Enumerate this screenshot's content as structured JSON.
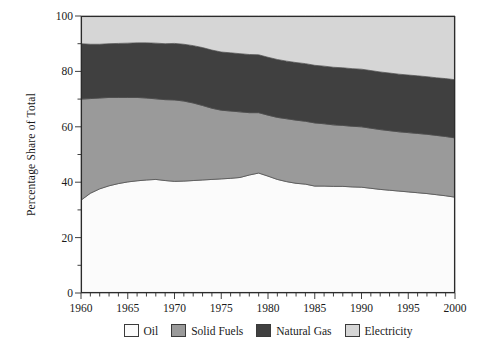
{
  "chart_data": {
    "type": "area",
    "title": "",
    "subtitle": "",
    "xlabel": "",
    "ylabel": "Percentage Share of Total",
    "xlim": [
      1960,
      2000
    ],
    "ylim": [
      0,
      100
    ],
    "grid": false,
    "stacked": true,
    "legend_position": "bottom",
    "x_major_ticks": [
      1960,
      1965,
      1970,
      1975,
      1980,
      1985,
      1990,
      1995,
      2000
    ],
    "x_tick_labels": [
      "1960",
      "1965",
      "1970",
      "1975",
      "1980",
      "1985",
      "1990",
      "1995",
      "2000"
    ],
    "x_minor_tick_step": 1,
    "y_major_ticks": [
      0,
      20,
      40,
      60,
      80,
      100
    ],
    "y_tick_labels": [
      "0",
      "20",
      "40",
      "60",
      "80",
      "100"
    ],
    "y_minor_tick_step": 10,
    "x": [
      1960,
      1961,
      1962,
      1963,
      1964,
      1965,
      1966,
      1967,
      1968,
      1969,
      1970,
      1971,
      1972,
      1973,
      1974,
      1975,
      1976,
      1977,
      1978,
      1979,
      1980,
      1981,
      1982,
      1983,
      1984,
      1985,
      1986,
      1987,
      1988,
      1989,
      1990,
      1991,
      1992,
      1993,
      1994,
      1995,
      1996,
      1997,
      1998,
      1999,
      2000
    ],
    "series": [
      {
        "name": "Oil",
        "color": "#fbfbfb",
        "values": [
          33.5,
          36.0,
          37.6,
          38.7,
          39.5,
          40.1,
          40.5,
          40.8,
          41.0,
          40.6,
          40.3,
          40.4,
          40.6,
          40.8,
          41.0,
          41.2,
          41.4,
          41.7,
          42.6,
          43.3,
          42.2,
          41.0,
          40.2,
          39.6,
          39.3,
          38.6,
          38.6,
          38.5,
          38.5,
          38.3,
          38.2,
          37.8,
          37.4,
          37.1,
          36.8,
          36.5,
          36.2,
          35.9,
          35.5,
          35.1,
          34.6
        ]
      },
      {
        "name": "Solid Fuels",
        "color": "#9a9a9a",
        "values": [
          36.5,
          34.2,
          32.8,
          31.9,
          31.1,
          30.5,
          30.1,
          29.6,
          29.1,
          29.2,
          29.4,
          28.9,
          28.0,
          26.9,
          25.7,
          24.8,
          24.3,
          23.7,
          22.5,
          21.8,
          22.0,
          22.4,
          22.7,
          22.8,
          22.7,
          22.8,
          22.5,
          22.2,
          22.0,
          21.9,
          21.8,
          21.7,
          21.6,
          21.5,
          21.4,
          21.4,
          21.4,
          21.4,
          21.4,
          21.4,
          21.4
        ]
      },
      {
        "name": "Natural Gas",
        "color": "#404040",
        "values": [
          20.0,
          19.6,
          19.4,
          19.4,
          19.5,
          19.6,
          19.7,
          19.9,
          20.1,
          20.2,
          20.4,
          20.5,
          20.7,
          20.9,
          21.0,
          21.0,
          21.0,
          21.0,
          21.0,
          20.9,
          20.9,
          20.9,
          20.8,
          20.8,
          20.8,
          20.8,
          20.8,
          20.8,
          20.8,
          20.8,
          20.8,
          20.8,
          20.8,
          20.8,
          20.8,
          20.8,
          20.8,
          20.8,
          20.8,
          20.9,
          21.0
        ]
      },
      {
        "name": "Electricity",
        "color": "#d6d6d6",
        "values": [
          10.0,
          10.2,
          10.2,
          10.0,
          9.9,
          9.8,
          9.7,
          9.7,
          9.8,
          10.0,
          9.9,
          10.2,
          10.7,
          11.4,
          12.3,
          13.0,
          13.3,
          13.6,
          13.9,
          14.0,
          14.9,
          15.7,
          16.3,
          16.8,
          17.2,
          17.8,
          18.1,
          18.5,
          18.7,
          19.0,
          19.2,
          19.7,
          20.2,
          20.6,
          21.0,
          21.3,
          21.6,
          21.9,
          22.3,
          22.6,
          23.0
        ]
      }
    ],
    "cumulative_boundaries": {
      "oil_top": [
        33.5,
        36.0,
        37.6,
        38.7,
        39.5,
        40.1,
        40.5,
        40.8,
        41.0,
        40.6,
        40.3,
        40.4,
        40.6,
        40.8,
        41.0,
        41.2,
        41.4,
        41.7,
        42.6,
        43.3,
        42.2,
        41.0,
        40.2,
        39.6,
        39.3,
        38.6,
        38.6,
        38.5,
        38.5,
        38.3,
        38.2,
        37.8,
        37.4,
        37.1,
        36.8,
        36.5,
        36.2,
        35.9,
        35.5,
        35.1,
        34.6
      ],
      "solid_fuels_top": [
        70.0,
        70.2,
        70.4,
        70.6,
        70.6,
        70.6,
        70.6,
        70.4,
        70.1,
        69.8,
        69.7,
        69.3,
        68.6,
        67.7,
        66.7,
        66.0,
        65.7,
        65.4,
        65.1,
        65.1,
        64.2,
        63.4,
        62.9,
        62.4,
        62.0,
        61.4,
        61.1,
        60.7,
        60.5,
        60.2,
        60.0,
        59.5,
        59.0,
        58.6,
        58.2,
        57.9,
        57.6,
        57.3,
        56.9,
        56.5,
        56.0
      ],
      "natural_gas_top": [
        90.0,
        89.8,
        89.8,
        90.0,
        90.1,
        90.2,
        90.3,
        90.3,
        90.2,
        90.0,
        90.1,
        89.8,
        89.3,
        88.6,
        87.7,
        87.0,
        86.7,
        86.4,
        86.1,
        86.0,
        85.1,
        84.3,
        83.7,
        83.2,
        82.8,
        82.2,
        81.9,
        81.5,
        81.3,
        81.0,
        80.8,
        80.3,
        79.8,
        79.4,
        79.0,
        78.7,
        78.4,
        78.1,
        77.7,
        77.4,
        77.0
      ],
      "electricity_top": [
        100,
        100,
        100,
        100,
        100,
        100,
        100,
        100,
        100,
        100,
        100,
        100,
        100,
        100,
        100,
        100,
        100,
        100,
        100,
        100,
        100,
        100,
        100,
        100,
        100,
        100,
        100,
        100,
        100,
        100,
        100,
        100,
        100,
        100,
        100,
        100,
        100,
        100,
        100,
        100,
        100
      ]
    },
    "legend": [
      {
        "label": "Oil",
        "color": "#fbfbfb"
      },
      {
        "label": "Solid Fuels",
        "color": "#9a9a9a"
      },
      {
        "label": "Natural Gas",
        "color": "#404040"
      },
      {
        "label": "Electricity",
        "color": "#d6d6d6"
      }
    ]
  },
  "axes": {
    "frame_color": "#2b2b2b",
    "plot_left": 81,
    "plot_right": 455,
    "plot_top": 16,
    "plot_bottom": 293
  }
}
